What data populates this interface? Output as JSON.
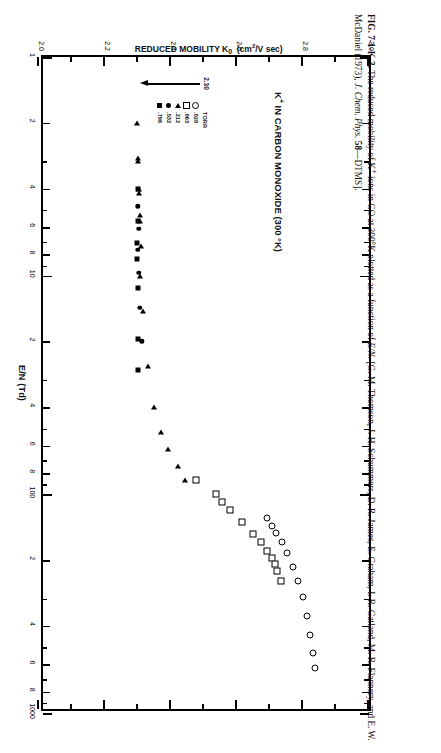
{
  "figure": {
    "title_main": "K",
    "title_sup": "+",
    "title_rest": " IN CARBON MONOXIDE (300 °K)",
    "caption_label": "FIG. 7-1-K-3.",
    "caption_text": " The reduced mobility of K⁺ ions in CO at 300°K plotted as a function of E/N. [G. M. Thomson, J. H. Schummers, D. R. James, E. Graham, I. R. Gatland, M. R. Flannery, and E. W. McDaniel (1973), J. Chem. Phys. 58—DTMS]."
  },
  "annotation": {
    "value_label": "2.30",
    "x": 1.35,
    "y": 2.3
  },
  "legend": {
    "unit_header": "TORR",
    "items": [
      {
        "symbol": "circle",
        "glyph": "○",
        "label": ".028 TORR",
        "pressure": ".028"
      },
      {
        "symbol": "square-open",
        "glyph": "□",
        "label": ".063",
        "pressure": ".063"
      },
      {
        "symbol": "triangle-left",
        "glyph": "◀",
        "label": ".212",
        "pressure": ".212"
      },
      {
        "symbol": "circle-filled",
        "glyph": "●",
        "label": ".532",
        "pressure": ".532"
      },
      {
        "symbol": "square-filled",
        "glyph": "■",
        "label": ".796",
        "pressure": ".796"
      }
    ]
  },
  "chart_data": {
    "type": "scatter",
    "xlabel": "E/N  (Td)",
    "ylabel": "REDUCED MOBILITY K₀  (cm²/V sec)",
    "xscale": "log",
    "yscale": "linear",
    "xlim": [
      1,
      1000
    ],
    "ylim": [
      2.0,
      3.0
    ],
    "grid": false,
    "legend_position": "inside-left",
    "xticks_major": [
      "1",
      "10",
      "100",
      "1000"
    ],
    "xticks_minor": [
      "2",
      "4",
      "6",
      "8"
    ],
    "yticks": [
      "2.0",
      "2.2",
      "2.4",
      "2.6",
      "2.8",
      "3.0"
    ],
    "series": [
      {
        "name": ".028 TORR",
        "symbol": "circle",
        "points": [
          {
            "x": 128,
            "y": 2.69
          },
          {
            "x": 140,
            "y": 2.705
          },
          {
            "x": 150,
            "y": 2.718
          },
          {
            "x": 166,
            "y": 2.736
          },
          {
            "x": 186,
            "y": 2.752
          },
          {
            "x": 214,
            "y": 2.77
          },
          {
            "x": 248,
            "y": 2.786
          },
          {
            "x": 295,
            "y": 2.8
          },
          {
            "x": 360,
            "y": 2.812
          },
          {
            "x": 440,
            "y": 2.822
          },
          {
            "x": 530,
            "y": 2.83
          },
          {
            "x": 620,
            "y": 2.836
          }
        ]
      },
      {
        "name": ".063 TORR",
        "symbol": "square-open",
        "points": [
          {
            "x": 86,
            "y": 2.477
          },
          {
            "x": 100,
            "y": 2.536
          },
          {
            "x": 108,
            "y": 2.556
          },
          {
            "x": 118,
            "y": 2.58
          },
          {
            "x": 134,
            "y": 2.614
          },
          {
            "x": 152,
            "y": 2.65
          },
          {
            "x": 166,
            "y": 2.672
          },
          {
            "x": 182,
            "y": 2.692
          },
          {
            "x": 196,
            "y": 2.706
          },
          {
            "x": 208,
            "y": 2.716
          },
          {
            "x": 224,
            "y": 2.722
          },
          {
            "x": 248,
            "y": 2.732
          }
        ]
      },
      {
        "name": ".212 TORR",
        "symbol": "triangle-left",
        "points": [
          {
            "x": 2.0,
            "y": 2.296
          },
          {
            "x": 2.9,
            "y": 2.3
          },
          {
            "x": 3.0,
            "y": 2.3
          },
          {
            "x": 4.0,
            "y": 2.302
          },
          {
            "x": 4.2,
            "y": 2.302
          },
          {
            "x": 5.3,
            "y": 2.305
          },
          {
            "x": 5.6,
            "y": 2.305
          },
          {
            "x": 7.3,
            "y": 2.309
          },
          {
            "x": 10.0,
            "y": 2.306
          },
          {
            "x": 14.5,
            "y": 2.316
          },
          {
            "x": 26.0,
            "y": 2.33
          },
          {
            "x": 40.0,
            "y": 2.35
          },
          {
            "x": 52.0,
            "y": 2.37
          },
          {
            "x": 62.0,
            "y": 2.392
          },
          {
            "x": 74.0,
            "y": 2.42
          },
          {
            "x": 86.0,
            "y": 2.442
          }
        ]
      },
      {
        "name": ".532 TORR",
        "symbol": "circle-filled",
        "points": [
          {
            "x": 4.8,
            "y": 2.3
          },
          {
            "x": 6.1,
            "y": 2.302
          },
          {
            "x": 7.6,
            "y": 2.3
          },
          {
            "x": 9.7,
            "y": 2.302
          },
          {
            "x": 14.0,
            "y": 2.305
          },
          {
            "x": 20.0,
            "y": 2.312
          }
        ]
      },
      {
        "name": ".796 TORR",
        "symbol": "square-filled",
        "points": [
          {
            "x": 4.0,
            "y": 2.3
          },
          {
            "x": 5.6,
            "y": 2.3
          },
          {
            "x": 7.1,
            "y": 2.297
          },
          {
            "x": 8.4,
            "y": 2.297
          },
          {
            "x": 11.4,
            "y": 2.299
          },
          {
            "x": 19.5,
            "y": 2.3
          },
          {
            "x": 27.0,
            "y": 2.3
          }
        ]
      }
    ]
  }
}
